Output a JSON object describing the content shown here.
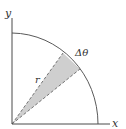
{
  "diagram": {
    "labels": {
      "y_axis": "y",
      "x_axis": "x",
      "radius": "r",
      "angle": "Δθ"
    },
    "colors": {
      "axis": "#4a4a4a",
      "arc": "#5a5a5a",
      "wedge_fill": "#cfcfcf",
      "wedge_edge": "#555555",
      "background": "#ffffff"
    },
    "shape": "quarter-circle with shaded sector"
  }
}
